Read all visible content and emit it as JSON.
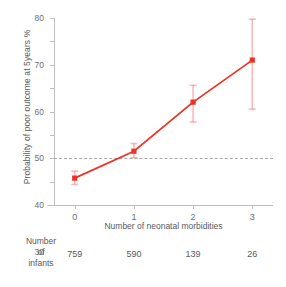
{
  "chart_data": {
    "type": "line",
    "title": "",
    "xlabel": "Number of neonatal morbidities",
    "ylabel": "Probability of poor outcome at 5years %",
    "x": [
      0,
      1,
      2,
      3
    ],
    "xticklabels": [
      "0",
      "1",
      "2",
      "3"
    ],
    "yticklabels": [
      "0",
      "10",
      "20",
      "30",
      "40",
      "50",
      "60",
      "70",
      "80"
    ],
    "yticks": [
      0,
      10,
      20,
      30,
      40,
      50,
      60,
      70,
      80
    ],
    "xlim": [
      -0.35,
      3.35
    ],
    "ylim": [
      0,
      80
    ],
    "grid": false,
    "legend": null,
    "series": [
      {
        "name": "Probability of poor outcome at 5 years",
        "values": [
          11.5,
          23.0,
          44.0,
          62.0
        ],
        "error_low": [
          8.8,
          20.3,
          35.5,
          41.0
        ],
        "error_high": [
          14.5,
          26.3,
          51.2,
          79.5
        ],
        "color": "#ee3124",
        "marker": "square"
      }
    ],
    "reference_line": {
      "name": "threshold",
      "y": 20,
      "style": "dashed",
      "color": "#a7a9ac"
    }
  },
  "counts_table": {
    "row_label": "Number\nof\ninfants",
    "row_label_lines": [
      "Number",
      "of",
      "infants"
    ],
    "values": [
      "759",
      "590",
      "139",
      "26"
    ]
  },
  "colors": {
    "series": "#ee3124",
    "axis": "#bcbec0",
    "text": "#58595b",
    "tick_text": "#6d6e71",
    "reference": "#a7a9ac",
    "background": "#ffffff"
  }
}
